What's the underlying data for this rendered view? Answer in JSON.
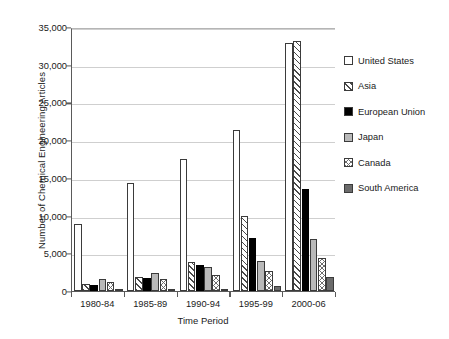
{
  "chart_data": {
    "type": "bar",
    "title": "",
    "xlabel": "Time Period",
    "ylabel": "Number of Chemical Engineering Articles",
    "categories": [
      "1980-84",
      "1985-89",
      "1990-94",
      "1995-99",
      "2000-06"
    ],
    "ylim": [
      0,
      35000
    ],
    "yticks": [
      0,
      5000,
      10000,
      15000,
      20000,
      25000,
      30000,
      35000
    ],
    "ytick_labels": [
      "0",
      "5,000",
      "10,000",
      "15,000",
      "20,000",
      "25,000",
      "30,000",
      "35,000"
    ],
    "grid": true,
    "legend_position": "right",
    "series": [
      {
        "name": "United States",
        "fill": "white",
        "color": "#ffffff",
        "values": [
          8900,
          14300,
          17500,
          21300,
          32900
        ]
      },
      {
        "name": "Asia",
        "fill": "diagonal-hatch",
        "color": "#ffffff",
        "values": [
          900,
          1800,
          3900,
          9900,
          33200
        ]
      },
      {
        "name": "European Union",
        "fill": "solid-black",
        "color": "#000000",
        "values": [
          800,
          1700,
          3400,
          7000,
          13500
        ]
      },
      {
        "name": "Japan",
        "fill": "solid-gray",
        "color": "#b9b9b9",
        "values": [
          1550,
          2350,
          3250,
          4000,
          6900
        ]
      },
      {
        "name": "Canada",
        "fill": "cross-hatch",
        "color": "#ffffff",
        "values": [
          1150,
          1550,
          2150,
          2600,
          4400
        ]
      },
      {
        "name": "South America",
        "fill": "solid-dark-gray",
        "color": "#6b6b6b",
        "values": [
          100,
          130,
          300,
          600,
          1900
        ]
      }
    ]
  }
}
